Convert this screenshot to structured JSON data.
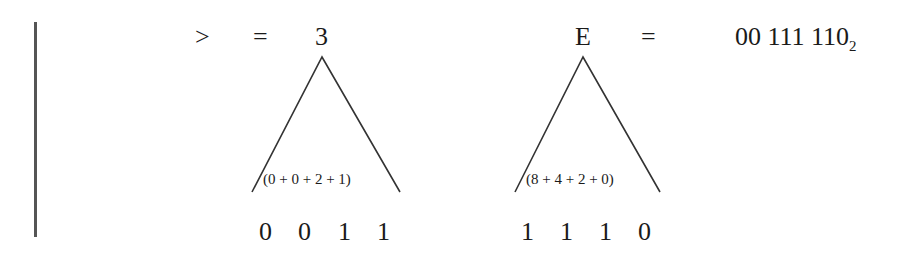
{
  "top_row": {
    "greater_than": ">",
    "equals_1": "=",
    "hex_digit_1": "3",
    "hex_digit_2": "E",
    "equals_2": "=",
    "binary_value": "00 111 110",
    "binary_base": "2"
  },
  "left_group": {
    "sum_expression": "(0 + 0 + 2 + 1)",
    "bits": [
      "0",
      "0",
      "1",
      "1"
    ]
  },
  "right_group": {
    "sum_expression": "(8 + 4 + 2 + 0)",
    "bits": [
      "1",
      "1",
      "1",
      "0"
    ]
  },
  "colors": {
    "text": "#1a1a1a",
    "lines": "#333333",
    "bar": "#555555"
  }
}
